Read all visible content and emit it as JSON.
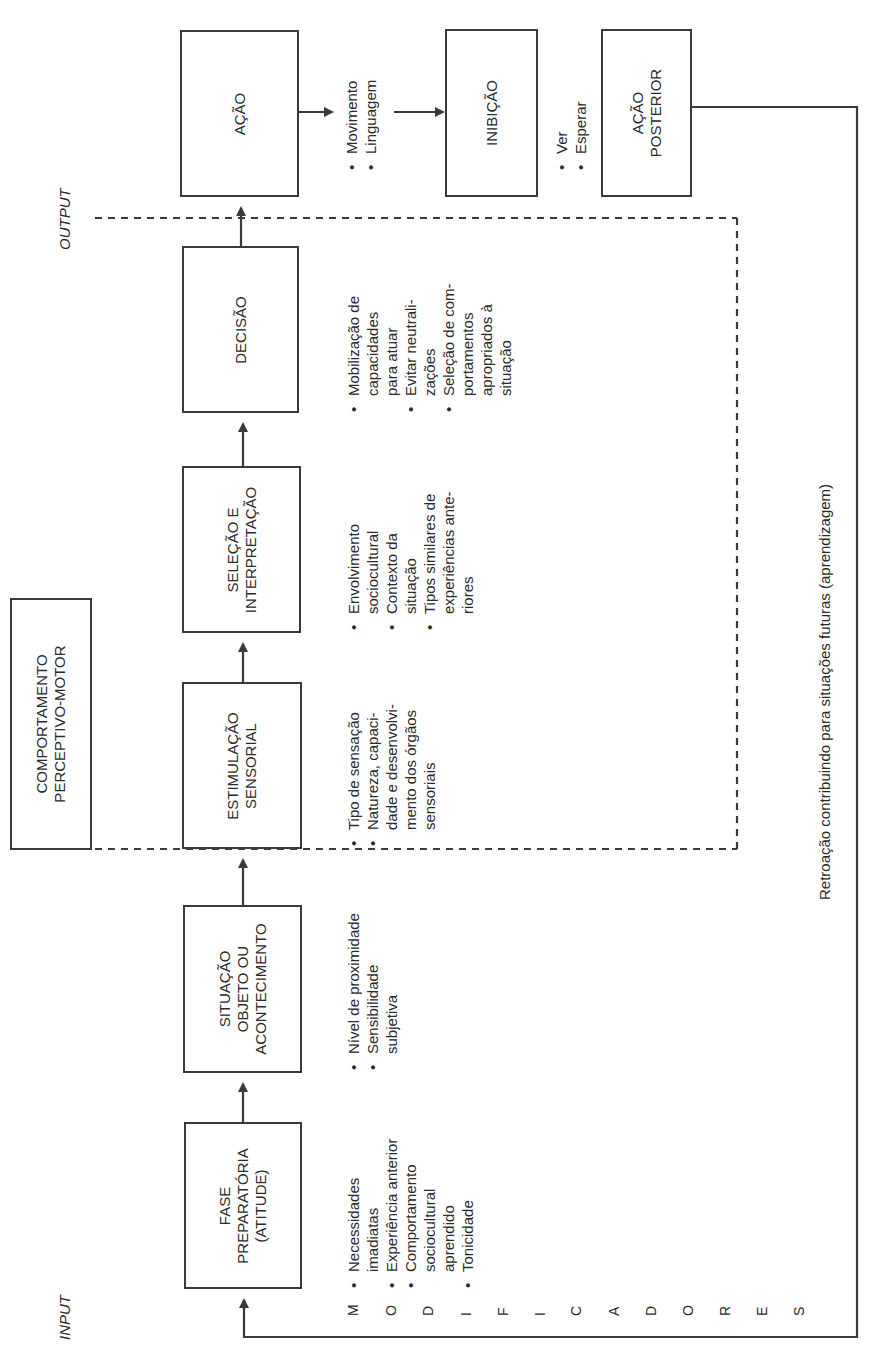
{
  "diagram": {
    "title": "COMPORTAMENTO PERCEPTIVO-MOTOR",
    "title_lines": [
      "COMPORTAMENTO",
      "PERCEPTIVO-MOTOR"
    ],
    "input_label": "INPUT",
    "output_label": "OUTPUT",
    "feedback_label": "Retroação contribuindo para situações futuras (aprendizagem)",
    "modifiers_letters": [
      "M",
      "O",
      "D",
      "I",
      "F",
      "I",
      "C",
      "A",
      "D",
      "O",
      "R",
      "E",
      "S"
    ],
    "modifiers_word": "MODIFICADORES",
    "boxes": [
      {
        "id": "fase",
        "lines": [
          "FASE",
          "PREPARATÓRIA",
          "(ATITUDE)"
        ],
        "bullets": [
          [
            "Necessidades",
            "imadiatas"
          ],
          [
            "Experiência anterior"
          ],
          [
            "Comportamento",
            "sociocultural",
            "aprendido"
          ],
          [
            "Tonicidade"
          ]
        ]
      },
      {
        "id": "situacao",
        "lines": [
          "SITUAÇÃO",
          "OBJETO OU",
          "ACONTECIMENTO"
        ],
        "bullets": [
          [
            "Nível de proximidade"
          ],
          [
            "Sensibilidade",
            "subjetiva"
          ]
        ]
      },
      {
        "id": "estimulacao",
        "lines": [
          "ESTIMULAÇÃO",
          "SENSORIAL"
        ],
        "bullets": [
          [
            "Tipo de sensação"
          ],
          [
            "Natureza, capaci-",
            "dade e desenvolvi-",
            "mento dos órgãos",
            "sensoriais"
          ]
        ]
      },
      {
        "id": "selecao",
        "lines": [
          "SELEÇÃO E",
          "INTERPRETAÇÃO"
        ],
        "bullets": [
          [
            "Envolvimento",
            "sociocultural"
          ],
          [
            "Contexto da",
            "situação"
          ],
          [
            "Tipos similares de",
            "experiências ante-",
            "riores"
          ]
        ]
      },
      {
        "id": "decisao",
        "lines": [
          "DECISÃO"
        ],
        "bullets": [
          [
            "Mobilização de",
            "capacidades",
            "para atuar"
          ],
          [
            "Evitar neutrali-",
            "zações"
          ],
          [
            "Seleção de com-",
            "portamentos",
            "apropriados à",
            "situação"
          ]
        ]
      },
      {
        "id": "acao",
        "lines": [
          "AÇÃO"
        ],
        "bullets": [
          [
            "Movimento"
          ],
          [
            "Linguagem"
          ]
        ]
      },
      {
        "id": "inibicao",
        "lines": [
          "INIBIÇÃO"
        ],
        "bullets": [
          [
            "Ver"
          ],
          [
            "Esperar"
          ]
        ]
      },
      {
        "id": "acao_posterior",
        "lines": [
          "AÇÃO",
          "POSTERIOR"
        ],
        "bullets": []
      }
    ],
    "colors": {
      "line": "#3a3a3a",
      "text": "#2a2a2a",
      "background": "#ffffff"
    }
  }
}
